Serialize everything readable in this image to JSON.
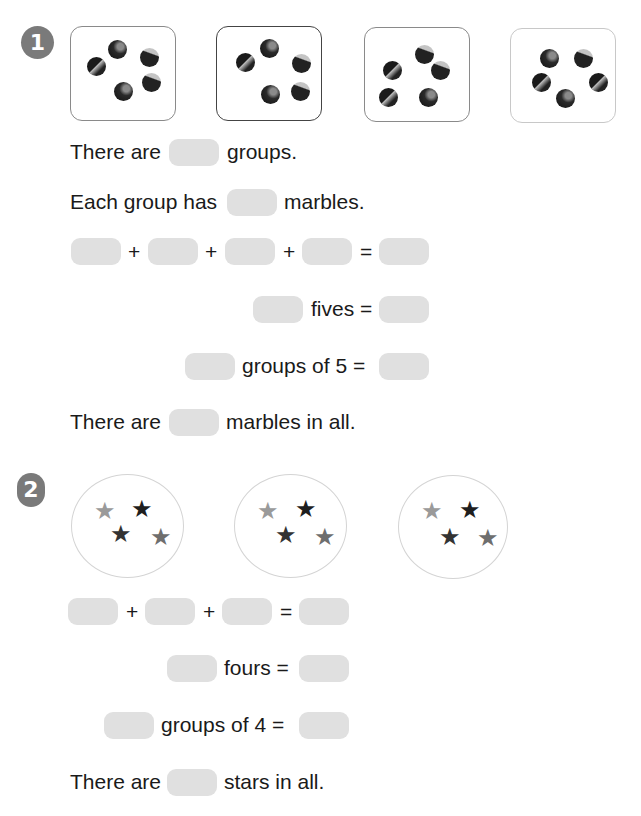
{
  "problem1": {
    "number": "1",
    "group_count_shown": 4,
    "marbles_per_group_shown": 5,
    "lines": {
      "there_are": "There are",
      "groups": "groups.",
      "each_group_has": "Each group has",
      "marbles": "marbles.",
      "plus": "+",
      "equals": "=",
      "fives_eq": "fives =",
      "groups_of_5_eq": "groups of 5 =",
      "marbles_in_all": "marbles in all."
    }
  },
  "problem2": {
    "number": "2",
    "group_count_shown": 3,
    "stars_per_group_shown": 4,
    "lines": {
      "plus": "+",
      "equals": "=",
      "fours_eq": "fours =",
      "groups_of_4_eq": "groups of 4 =",
      "there_are": "There are",
      "stars_in_all": "stars in all."
    },
    "star_glyph": "★"
  },
  "colors": {
    "badge": "#7a7a7a",
    "blank": "#e0e0e0"
  }
}
